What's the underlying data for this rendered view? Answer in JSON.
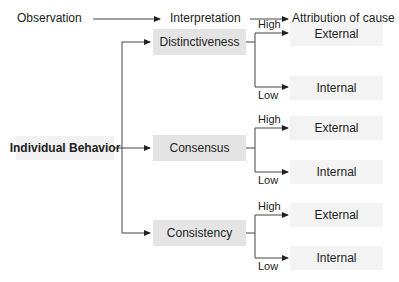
{
  "header": {
    "steps": [
      "Observation",
      "Interpretation",
      "Attribution of cause"
    ]
  },
  "root": {
    "label": "Individual Behavior"
  },
  "factors": [
    {
      "label": "Distinctiveness",
      "high": "High",
      "low": "Low",
      "high_result": "External",
      "low_result": "Internal"
    },
    {
      "label": "Consensus",
      "high": "High",
      "low": "Low",
      "high_result": "External",
      "low_result": "Internal"
    },
    {
      "label": "Consistency",
      "high": "High",
      "low": "Low",
      "high_result": "External",
      "low_result": "Internal"
    }
  ],
  "colors": {
    "line": "#444444",
    "factor_box": "#e4e4e4",
    "result_box": "#f3f3f3"
  }
}
